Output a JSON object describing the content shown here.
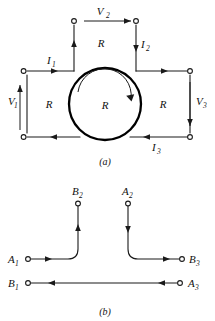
{
  "figure": {
    "panels": [
      {
        "id": "a",
        "caption": "(a)",
        "description": "three-port network with circulating element",
        "element_labels": [
          {
            "name": "R",
            "position": "top"
          },
          {
            "name": "R",
            "position": "left"
          },
          {
            "name": "R",
            "position": "center"
          },
          {
            "name": "R",
            "position": "right"
          }
        ],
        "voltage_labels": [
          {
            "base": "V",
            "sub": "1",
            "position": "left",
            "arrow": "up"
          },
          {
            "base": "V",
            "sub": "2",
            "position": "top",
            "arrow": "right"
          },
          {
            "base": "V",
            "sub": "3",
            "position": "right",
            "arrow": "down"
          }
        ],
        "current_labels": [
          {
            "base": "I",
            "sub": "1",
            "position": "top-left",
            "arrow": "right"
          },
          {
            "base": "I",
            "sub": "2",
            "position": "top-right",
            "arrow": "down"
          },
          {
            "base": "I",
            "sub": "3",
            "position": "bottom-right",
            "arrow": "left"
          }
        ],
        "circulation_arrow": "clockwise"
      },
      {
        "id": "b",
        "caption": "(b)",
        "description": "terminal interconnection diagram",
        "terminals": [
          {
            "base": "B",
            "sub": "2",
            "position": "top-left-stub"
          },
          {
            "base": "A",
            "sub": "2",
            "position": "top-right-stub"
          },
          {
            "base": "A",
            "sub": "1",
            "position": "middle-left"
          },
          {
            "base": "B",
            "sub": "3",
            "position": "middle-right"
          },
          {
            "base": "B",
            "sub": "1",
            "position": "bottom-left"
          },
          {
            "base": "A",
            "sub": "3",
            "position": "bottom-right"
          }
        ],
        "connections": [
          {
            "from": "A1",
            "to": "B2",
            "arrows": [
              "right",
              "up"
            ]
          },
          {
            "from": "A2",
            "to": "B3",
            "arrows": [
              "down",
              "right"
            ]
          },
          {
            "from": "A3",
            "to": "B1",
            "arrows": [
              "left",
              "left"
            ]
          }
        ]
      }
    ]
  },
  "colors": {
    "ink": "#1a1a1a",
    "background": "#ffffff"
  }
}
